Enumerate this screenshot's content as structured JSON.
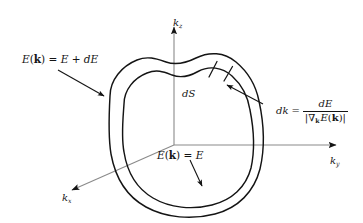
{
  "figure": {
    "background_color": "#ffffff",
    "line_color": "#141414",
    "axis_color": "#8a8a8a"
  },
  "axes": {
    "kz": {
      "label": "k",
      "subscript": "z",
      "name": "kz-axis"
    },
    "ky": {
      "label": "k",
      "subscript": "y",
      "name": "ky-axis"
    },
    "kx": {
      "label": "k",
      "subscript": "x",
      "name": "kx-axis"
    }
  },
  "labels": {
    "outer_surface": {
      "E": "E",
      "open_paren": "(",
      "k_bold": "k",
      "close_paren": ")",
      "equals": " = ",
      "value": "E + dE",
      "full_text": "E(k) = E + dE"
    },
    "inner_surface": {
      "E": "E",
      "open_paren": "(",
      "k_bold": "k",
      "close_paren": ")",
      "equals": " = ",
      "value": "E",
      "full_text": "E(k) = E"
    },
    "surface_element": "dS",
    "thickness": {
      "lhs": "dk",
      "equals": "=",
      "numerator": "dE",
      "denominator_open": "|",
      "denominator_nabla": "∇",
      "denominator_nabla_sub": "k",
      "denominator_E": "E",
      "denominator_paren_open": "(",
      "denominator_k": "k",
      "denominator_paren_close": ")",
      "denominator_close": "|",
      "full_text": "dk = dE / |∇k E(k)|"
    }
  }
}
